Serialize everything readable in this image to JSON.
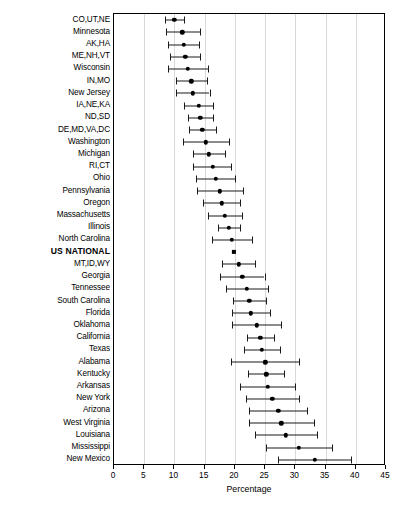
{
  "chart_data": {
    "type": "scatter",
    "subtype": "dot-and-whisker forest plot",
    "title": "",
    "xlabel": "Percentage",
    "ylabel": "",
    "xlim": [
      0,
      45
    ],
    "xticks": [
      0,
      5,
      10,
      15,
      20,
      25,
      30,
      35,
      40,
      45
    ],
    "grid": true,
    "legend": "none",
    "orientation": "horizontal",
    "marker_color": "#000000",
    "grid_color": "#d9d9d9",
    "categories": [
      "CO,UT,NE",
      "Minnesota",
      "AK,HA",
      "ME,NH,VT",
      "Wisconsin",
      "IN,MO",
      "New Jersey",
      "IA,NE,KA",
      "ND,SD",
      "DE,MD,VA,DC",
      "Washington",
      "Michigan",
      "RI,CT",
      "Ohio",
      "Pennsylvania",
      "Oregon",
      "Massachusetts",
      "Illinois",
      "North Carolina",
      "US NATIONAL",
      "MT,ID,WY",
      "Georgia",
      "Tennessee",
      "South Carolina",
      "Florida",
      "Oklahoma",
      "California",
      "Texas",
      "Alabama",
      "Kentucky",
      "Arkansas",
      "New York",
      "Arizona",
      "West Virginia",
      "Louisiana",
      "Mississippi",
      "New Mexico"
    ],
    "values": [
      10.0,
      11.3,
      11.5,
      11.8,
      12.2,
      12.8,
      13.0,
      14.0,
      14.3,
      14.6,
      15.2,
      15.7,
      16.3,
      16.8,
      17.5,
      17.8,
      18.3,
      19.0,
      19.5,
      19.8,
      20.6,
      21.2,
      22.0,
      22.4,
      22.6,
      23.6,
      24.2,
      24.5,
      25.0,
      25.2,
      25.4,
      26.2,
      27.2,
      27.7,
      28.4,
      30.6,
      33.2
    ],
    "ci_low": [
      8.4,
      8.6,
      9.0,
      9.3,
      8.9,
      10.3,
      10.2,
      11.6,
      12.3,
      12.4,
      11.4,
      13.0,
      13.1,
      13.6,
      13.8,
      14.8,
      15.5,
      17.2,
      16.2,
      19.8,
      17.9,
      17.5,
      18.6,
      19.7,
      19.5,
      19.5,
      22.0,
      21.5,
      19.3,
      22.2,
      20.9,
      21.8,
      22.4,
      22.4,
      23.3,
      25.1,
      27.2
    ],
    "ci_high": [
      11.6,
      14.2,
      14.0,
      14.3,
      15.5,
      15.4,
      15.8,
      16.4,
      16.4,
      16.8,
      19.0,
      18.4,
      19.4,
      20.1,
      21.3,
      20.8,
      21.1,
      20.8,
      22.9,
      19.8,
      23.3,
      24.9,
      25.5,
      25.1,
      25.8,
      27.7,
      26.4,
      27.5,
      30.6,
      28.2,
      29.9,
      30.6,
      32.0,
      33.1,
      33.6,
      36.1,
      39.2
    ],
    "marker_shapes": [
      "circle",
      "circle",
      "circle",
      "circle",
      "circle",
      "circle",
      "circle",
      "circle",
      "circle",
      "circle",
      "circle",
      "circle",
      "circle",
      "circle",
      "circle",
      "circle",
      "circle",
      "circle",
      "circle",
      "square",
      "circle",
      "circle",
      "circle",
      "circle",
      "circle",
      "circle",
      "circle",
      "circle",
      "circle",
      "circle",
      "circle",
      "circle",
      "circle",
      "circle",
      "circle",
      "circle",
      "circle"
    ],
    "highlight_category": "US NATIONAL"
  },
  "axis": {
    "x_title": "Percentage",
    "x_tick_labels": [
      "0",
      "5",
      "10",
      "15",
      "20",
      "25",
      "30",
      "35",
      "40",
      "45"
    ]
  }
}
